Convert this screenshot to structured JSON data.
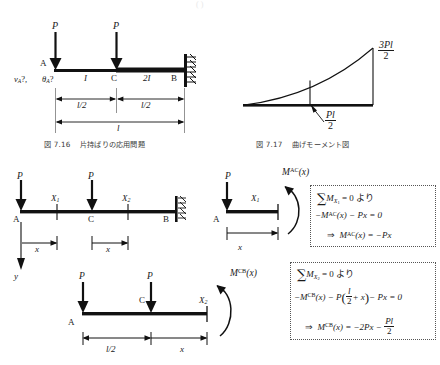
{
  "page": {
    "width": 440,
    "height": 365,
    "background": "#ffffff",
    "ink": "#1a1a1a",
    "cut_off_header": "( )"
  },
  "figures": [
    {
      "id": "fig-7-16",
      "caption_number": "図 7.16",
      "caption_text": "片持ばりの応用問題",
      "labels": {
        "load_left": "P",
        "load_mid": "P",
        "node_a": "A",
        "node_c": "C",
        "node_b": "B",
        "unknown_v": "v",
        "unknown_v_sub": "A",
        "unknown_v_q": "?,",
        "unknown_theta": "θ",
        "unknown_theta_sub": "A",
        "unknown_theta_q": "?",
        "stiffness_left": "I",
        "stiffness_right": "2I",
        "dim_left": "l/2",
        "dim_right": "l/2",
        "dim_total": "l"
      }
    },
    {
      "id": "fig-7-17",
      "caption_number": "図 7.17",
      "caption_text": "曲げモーメント図",
      "labels": {
        "peak_num": "3Pl",
        "peak_den": "2",
        "mid_num": "Pl",
        "mid_den": "2"
      }
    }
  ],
  "fbd_full": {
    "name": "full-beam-section-diagram",
    "labels": {
      "load_left": "P",
      "load_mid": "P",
      "node_a": "A",
      "node_c": "C",
      "node_b": "B",
      "cut_1": "X",
      "cut_1_sub": "1",
      "cut_2": "X",
      "cut_2_sub": "2",
      "x_left": "x",
      "x_right": "x",
      "axis_y": "y"
    }
  },
  "fbd_ac": {
    "name": "free-body-ac",
    "labels": {
      "load": "P",
      "node_a": "A",
      "cut": "X",
      "cut_sub": "1",
      "dim_x": "x",
      "moment": "M",
      "moment_sup": "AC",
      "moment_arg": "(x)"
    }
  },
  "fbd_cb": {
    "name": "free-body-cb",
    "labels": {
      "load_left": "P",
      "load_mid": "P",
      "node_a": "A",
      "node_c": "C",
      "cut": "X",
      "cut_sub": "2",
      "dim_half": "l/2",
      "dim_x": "x",
      "moment": "M",
      "moment_sup": "CB",
      "moment_arg": "(x)"
    }
  },
  "equation_box_ac": {
    "name": "equation-box-ac",
    "line1_sum": "∑",
    "line1_m": "M",
    "line1_sub": "X",
    "line1_subsub": "1",
    "line1_rest": "= 0 より",
    "line2": "−M",
    "line2_sup": "AC",
    "line2_rest": "(x) − Px = 0",
    "line3_arrow": "⇒",
    "line3_m": "M",
    "line3_sup": "AC",
    "line3_rest": "(x) = −Px"
  },
  "equation_box_cb": {
    "name": "equation-box-cb",
    "line1_sum": "∑",
    "line1_m": "M",
    "line1_sub": "X",
    "line1_subsub": "2",
    "line1_rest": "= 0 より",
    "line2_a": "−M",
    "line2_sup": "CB",
    "line2_b": "(x) − P",
    "line2_paren_open": "(",
    "line2_frac_num": "l",
    "line2_frac_den": "2",
    "line2_plus": "+ x",
    "line2_paren_close": ")",
    "line2_c": "− Px = 0",
    "line3_arrow": "⇒",
    "line3_m": "M",
    "line3_sup": "CB",
    "line3_a": "(x) = −2Px −",
    "line3_frac_num": "Pl",
    "line3_frac_den": "2"
  }
}
